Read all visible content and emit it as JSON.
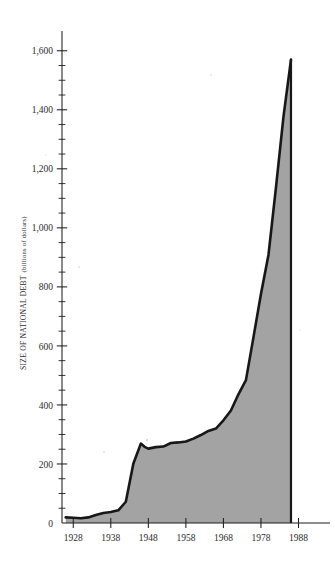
{
  "chart_data": {
    "type": "area",
    "title": "",
    "xlabel": "",
    "ylabel": "SIZE OF NATIONAL DEBT",
    "ylabel_units": "(billions of dollars)",
    "ylim": [
      0,
      1650
    ],
    "xlim": [
      1925,
      1990
    ],
    "grid": false,
    "legend": null,
    "y_major_ticks": [
      0,
      200,
      400,
      600,
      800,
      1000,
      1200,
      1400,
      1600
    ],
    "y_major_tick_labels": [
      "0",
      "200",
      "400",
      "600",
      "800",
      "1,000",
      "1,200",
      "1,400",
      "1,600"
    ],
    "y_minor_tick_interval": 50,
    "x_major_ticks": [
      1928,
      1938,
      1948,
      1958,
      1968,
      1978,
      1988
    ],
    "x_major_tick_labels": [
      "1928",
      "1938",
      "1948",
      "1958",
      "1968",
      "1978",
      "1988"
    ],
    "series": [
      {
        "name": "National debt",
        "x": [
          1926,
          1928,
          1930,
          1932,
          1934,
          1936,
          1938,
          1940,
          1942,
          1944,
          1946,
          1947,
          1948,
          1950,
          1952,
          1954,
          1956,
          1958,
          1960,
          1962,
          1964,
          1966,
          1968,
          1970,
          1972,
          1974,
          1976,
          1978,
          1980,
          1982,
          1984,
          1986
        ],
        "values": [
          19,
          18,
          16,
          19,
          27,
          34,
          37,
          43,
          72,
          201,
          269,
          258,
          252,
          257,
          259,
          271,
          273,
          276,
          286,
          298,
          312,
          320,
          348,
          381,
          436,
          484,
          629,
          776,
          908,
          1137,
          1377,
          1570
        ]
      }
    ],
    "peak": {
      "year": 1986,
      "value": 1570
    },
    "colors": {
      "fill": "#a3a3a3",
      "line": "#171717",
      "axis": "#1f1f1f",
      "background": "#ffffff",
      "text": "#2b2b2b"
    }
  }
}
